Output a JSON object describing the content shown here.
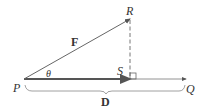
{
  "diagram": {
    "labels": {
      "P": "P",
      "Q": "Q",
      "R": "R",
      "S": "S",
      "theta": "θ",
      "force": "F",
      "displacement": "D"
    },
    "colors": {
      "line": "#555555",
      "thick_line": "#444444",
      "text": "#333333"
    }
  }
}
